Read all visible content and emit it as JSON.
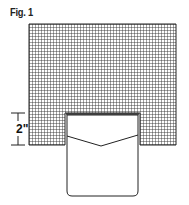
{
  "figure": {
    "label": "Fig. 1",
    "dimension": {
      "value": "2\"",
      "description": "height of pocket overlap into grid"
    },
    "grid": {
      "x": 29,
      "y": 24,
      "width": 147,
      "height": 121,
      "cell_size": 3,
      "line_color": "#333333"
    },
    "cutout": {
      "x": 65,
      "y": 113,
      "width": 75,
      "height": 32
    },
    "pocket": {
      "x": 67,
      "y": 115,
      "width": 71,
      "bottom": 196,
      "corner_radius": 5,
      "flap": {
        "left_y": 136,
        "point_x": 101,
        "point_y": 146,
        "right_y": 135
      }
    },
    "colors": {
      "stroke": "#222222",
      "background": "#ffffff"
    }
  }
}
